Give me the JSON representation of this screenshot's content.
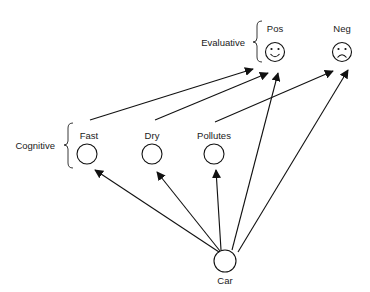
{
  "diagram": {
    "groups": {
      "evaluative": {
        "label": "Evaluative"
      },
      "cognitive": {
        "label": "Cognitive"
      }
    },
    "nodes": {
      "pos": {
        "label": "Pos",
        "icon": "smiley-face-icon"
      },
      "neg": {
        "label": "Neg",
        "icon": "frowny-face-icon"
      },
      "fast": {
        "label": "Fast"
      },
      "dry": {
        "label": "Dry"
      },
      "pollutes": {
        "label": "Pollutes"
      },
      "car": {
        "label": "Car"
      }
    },
    "edges": [
      {
        "from": "Fast",
        "to": "Pos"
      },
      {
        "from": "Dry",
        "to": "Pos"
      },
      {
        "from": "Pollutes",
        "to": "Neg"
      },
      {
        "from": "Car",
        "to": "Fast"
      },
      {
        "from": "Car",
        "to": "Dry"
      },
      {
        "from": "Car",
        "to": "Pollutes"
      },
      {
        "from": "Car",
        "to": "Pos"
      },
      {
        "from": "Car",
        "to": "Neg"
      }
    ],
    "colors": {
      "stroke": "#111111",
      "background": "#ffffff"
    }
  }
}
